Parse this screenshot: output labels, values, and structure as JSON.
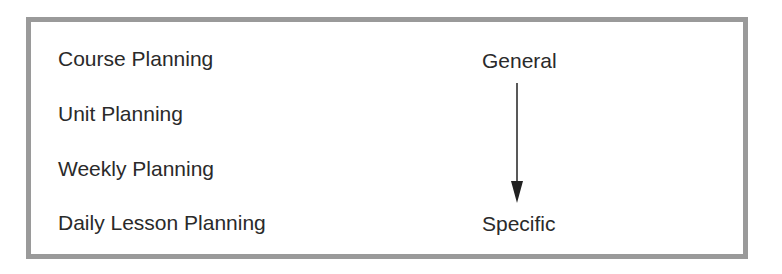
{
  "levels": [
    {
      "label": "Course Planning"
    },
    {
      "label": "Unit Planning"
    },
    {
      "label": "Weekly Planning"
    },
    {
      "label": "Daily Lesson Planning"
    }
  ],
  "scale": {
    "top_label": "General",
    "bottom_label": "Specific"
  }
}
